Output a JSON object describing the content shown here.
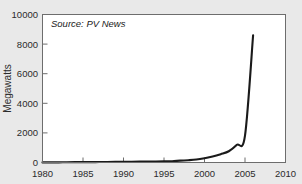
{
  "chart_data": {
    "type": "line",
    "title": "",
    "subtitle": "",
    "xlabel": "",
    "ylabel": "Megawatts",
    "xlim": [
      1980,
      2010
    ],
    "ylim": [
      0,
      10000
    ],
    "grid": false,
    "legend": false,
    "annotations": [
      {
        "name": "source-note",
        "text": "Source: PV News"
      }
    ],
    "x_ticks": [
      1980,
      1985,
      1990,
      1995,
      2000,
      2005,
      2010
    ],
    "x_tick_labels": [
      "1980",
      "1985",
      "1990",
      "1995",
      "2000",
      "2005",
      "2010"
    ],
    "y_ticks": [
      0,
      2000,
      4000,
      6000,
      8000,
      10000
    ],
    "y_tick_labels": [
      "0",
      "2000",
      "4000",
      "6000",
      "8000",
      "10000"
    ],
    "series": [
      {
        "name": "World Photovoltaic Production",
        "color": "#1a1a1a",
        "x": [
          1980,
          1981,
          1982,
          1983,
          1984,
          1985,
          1986,
          1987,
          1988,
          1989,
          1990,
          1991,
          1992,
          1993,
          1994,
          1995,
          1996,
          1997,
          1998,
          1999,
          2000,
          2001,
          2002,
          2003,
          2004,
          2005,
          2006
        ],
        "values": [
          7,
          8,
          9,
          17,
          22,
          23,
          26,
          29,
          34,
          40,
          46,
          55,
          58,
          60,
          69,
          78,
          89,
          126,
          155,
          201,
          288,
          401,
          562,
          760,
          1195,
          1815,
          8600
        ]
      }
    ]
  },
  "figure": {
    "background_color": "#e9e9e9",
    "plot_background_color": "#ffffff",
    "frame_color": "#6d6d6d"
  }
}
